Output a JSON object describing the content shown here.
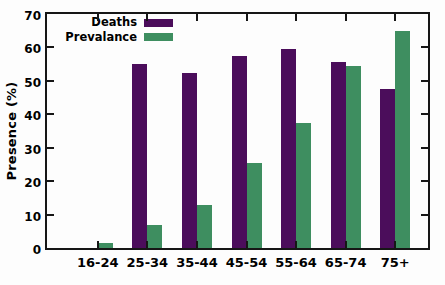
{
  "chart_data": {
    "type": "bar",
    "title": "",
    "ylabel": "Presence (%)",
    "xlabel": "",
    "ylim": [
      0,
      70
    ],
    "yticks": [
      0,
      10,
      20,
      30,
      40,
      50,
      60,
      70
    ],
    "grid": false,
    "legend_position": "top-left",
    "axis_color": "#161616",
    "background": "#fdfdfd",
    "categories": [
      "16-24",
      "25-34",
      "35-44",
      "45-54",
      "55-64",
      "65-74",
      "75+"
    ],
    "series": [
      {
        "name": "Deaths",
        "color": "#4b0d5b",
        "values": [
          0,
          55,
          52.5,
          57.5,
          59.5,
          55.5,
          47.5
        ]
      },
      {
        "name": "Prevalance",
        "color": "#3e8e60",
        "values": [
          1.5,
          7,
          13,
          25.5,
          37.5,
          54.5,
          65
        ]
      }
    ]
  }
}
